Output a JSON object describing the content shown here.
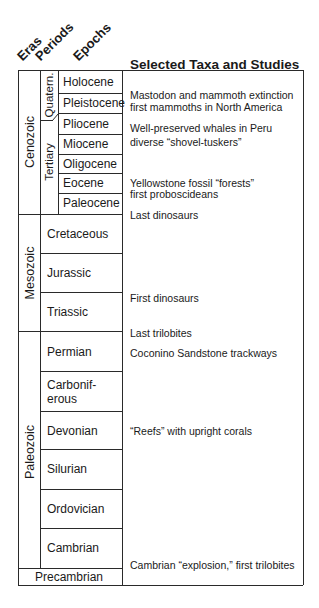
{
  "header": {
    "col_eras": "Eras",
    "col_periods": "Periods",
    "col_epochs": "Epochs",
    "title": "Selected Taxa and Studies"
  },
  "eras": [
    {
      "name": "Cenozoic"
    },
    {
      "name": "Mesozoic"
    },
    {
      "name": "Paleozoic"
    },
    {
      "name": "Precambrian"
    }
  ],
  "periods": [
    {
      "name": "Quatern."
    },
    {
      "name": "Tertiary"
    }
  ],
  "epochs": [
    {
      "name": "Holocene"
    },
    {
      "name": "Pleistocene"
    },
    {
      "name": "Pliocene"
    },
    {
      "name": "Miocene"
    },
    {
      "name": "Oligocene"
    },
    {
      "name": "Eocene"
    },
    {
      "name": "Paleocene"
    }
  ],
  "mesozoic_periods": [
    {
      "name": "Cretaceous"
    },
    {
      "name": "Jurassic"
    },
    {
      "name": "Triassic"
    }
  ],
  "paleozoic_periods": [
    {
      "name": "Permian"
    },
    {
      "name": "Carbonif-"
    },
    {
      "name": "erous"
    },
    {
      "name": "Devonian"
    },
    {
      "name": "Silurian"
    },
    {
      "name": "Ordovician"
    },
    {
      "name": "Cambrian"
    }
  ],
  "notes": [
    {
      "text": "Mastodon and mammoth extinction"
    },
    {
      "text": "first mammoths in North America"
    },
    {
      "text": "Well-preserved whales in Peru"
    },
    {
      "text": "diverse “shovel-tuskers”"
    },
    {
      "text": "Yellowstone fossil “forests”"
    },
    {
      "text": "first proboscideans"
    },
    {
      "text": "Last dinosaurs"
    },
    {
      "text": "First dinosaurs"
    },
    {
      "text": "Last trilobites"
    },
    {
      "text": "Coconino Sandstone trackways"
    },
    {
      "text": "“Reefs” with upright corals"
    },
    {
      "text": "Cambrian “explosion,” first trilobites"
    }
  ]
}
